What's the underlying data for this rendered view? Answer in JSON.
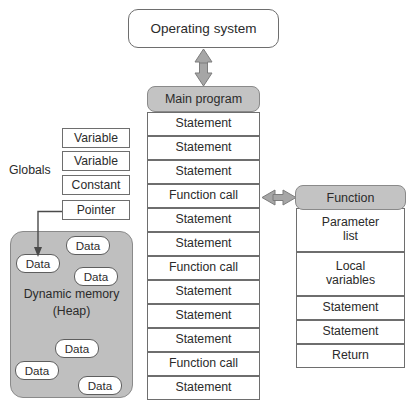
{
  "diagram": {
    "colors": {
      "header_fill": "#c3c3c3",
      "heap_fill": "#bfbfbf",
      "box_fill": "#ffffff",
      "stroke": "#6e6e6e",
      "arrow_fill": "#a6a6a6",
      "arrow_stroke": "#7d7d7d",
      "text": "#2b2b2b"
    }
  },
  "os": {
    "label": "Operating system"
  },
  "main_program": {
    "header": "Main program",
    "rows": [
      "Statement",
      "Statement",
      "Statement",
      "Function call",
      "Statement",
      "Statement",
      "Function call",
      "Statement",
      "Statement",
      "Statement",
      "Function call",
      "Statement"
    ]
  },
  "function": {
    "header": "Function",
    "rows": [
      "Parameter\nlist",
      "Local\nvariables",
      "Statement",
      "Statement",
      "Return"
    ],
    "rows_flat": [
      "Parameter list",
      "Local variables",
      "Statement",
      "Statement",
      "Return"
    ]
  },
  "globals": {
    "label": "Globals",
    "items": [
      "Variable",
      "Variable",
      "Constant",
      "Pointer"
    ]
  },
  "heap": {
    "label_line1": "Dynamic memory",
    "label_line2": "(Heap)",
    "blocks": [
      {
        "label": "Data",
        "x": 16,
        "y": 254
      },
      {
        "label": "Data",
        "x": 66,
        "y": 236
      },
      {
        "label": "Data",
        "x": 74,
        "y": 267
      },
      {
        "label": "Data",
        "x": 55,
        "y": 339
      },
      {
        "label": "Data",
        "x": 15,
        "y": 361
      },
      {
        "label": "Data",
        "x": 78,
        "y": 376
      }
    ]
  },
  "arrows": {
    "os_main": "double-arrow-vertical",
    "main_function": "double-arrow-horizontal",
    "pointer_heap": "pointer-arrow"
  }
}
